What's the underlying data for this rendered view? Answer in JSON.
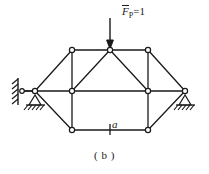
{
  "figure": {
    "caption": "( b )",
    "load_label": {
      "symbol": "F",
      "subscript": "P",
      "equals_value": "=1",
      "full": "F̄P=1"
    },
    "dimension_label": "a",
    "stroke_color": "#1a1a1a",
    "background_color": "#ffffff",
    "node_fill_color": "#ffffff"
  },
  "structure": {
    "type": "truss-diagram",
    "nodes": [
      {
        "id": "L0",
        "name": "left-link-wall-node",
        "x": 22,
        "y": 91
      },
      {
        "id": "L1",
        "name": "left-apex-node",
        "x": 35,
        "y": 91
      },
      {
        "id": "T1",
        "name": "top-left-node",
        "x": 72,
        "y": 50
      },
      {
        "id": "T2",
        "name": "top-apex-node",
        "x": 110,
        "y": 50
      },
      {
        "id": "T3",
        "name": "top-right-node",
        "x": 148,
        "y": 50
      },
      {
        "id": "M1",
        "name": "mid-left-node",
        "x": 72,
        "y": 91
      },
      {
        "id": "M2",
        "name": "mid-right-node",
        "x": 148,
        "y": 91
      },
      {
        "id": "B1",
        "name": "bottom-left-node",
        "x": 72,
        "y": 130
      },
      {
        "id": "B2",
        "name": "bottom-right-node",
        "x": 148,
        "y": 130
      },
      {
        "id": "R1",
        "name": "right-apex-node",
        "x": 185,
        "y": 91
      }
    ],
    "members": [
      [
        "L0",
        "L1"
      ],
      [
        "L1",
        "T1"
      ],
      [
        "L1",
        "M1"
      ],
      [
        "L1",
        "B1"
      ],
      [
        "T1",
        "T2"
      ],
      [
        "T2",
        "T3"
      ],
      [
        "T1",
        "M1"
      ],
      [
        "T2",
        "M1"
      ],
      [
        "T2",
        "M2"
      ],
      [
        "T3",
        "M2"
      ],
      [
        "M1",
        "B1"
      ],
      [
        "M1",
        "M2"
      ],
      [
        "M2",
        "B2"
      ],
      [
        "B1",
        "B2"
      ],
      [
        "M2",
        "R1"
      ],
      [
        "T3",
        "R1"
      ],
      [
        "B2",
        "R1"
      ]
    ],
    "supports": [
      {
        "name": "left-support",
        "kind": "link-to-wall-with-pin",
        "x": 35,
        "y": 91
      },
      {
        "name": "right-support",
        "kind": "pin",
        "x": 185,
        "y": 91
      }
    ],
    "load": {
      "name": "point-load-arrow",
      "x": 110,
      "y_start": 18,
      "y_end": 48,
      "direction": "down",
      "magnitude": "1"
    },
    "dimension_tick": {
      "name": "dimension-tick",
      "x": 110,
      "y": 130
    }
  }
}
